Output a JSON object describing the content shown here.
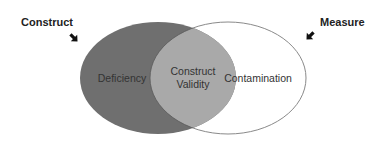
{
  "diagram": {
    "type": "venn",
    "sets": [
      {
        "id": "construct",
        "label": "Construct",
        "arrow": "arrow-down-right"
      },
      {
        "id": "measure",
        "label": "Measure",
        "arrow": "arrow-down-left"
      }
    ],
    "regions": {
      "construct_only": {
        "label": "Deficiency"
      },
      "intersection": {
        "line1": "Construct",
        "line2": "Validity"
      },
      "measure_only": {
        "label": "Contamination"
      }
    },
    "colors": {
      "construct_fill": "#6f6f6f",
      "intersection_fill": "#a9a9a9",
      "measure_fill": "#ffffff",
      "outline": "#8a8a8a",
      "arrow": "#111111"
    }
  }
}
